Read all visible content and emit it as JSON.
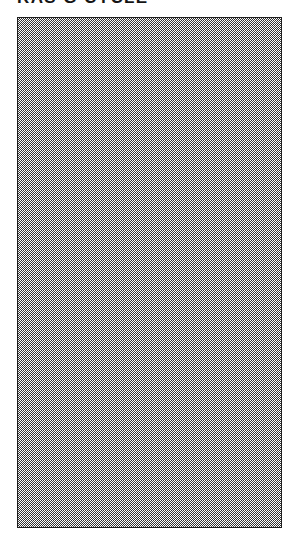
{
  "document": {
    "heading": "RAS G CYCLE",
    "heading_is_clipped_by_page_edge": true,
    "background_color": "#ffffff",
    "text_color": "#151515"
  },
  "figure": {
    "label": "dithered-halftone-field",
    "border_color": "#1d1d1d",
    "fill_description": "uniform 1-pixel checkerboard dither (~50% gray)",
    "fill_dark_color": "#2b2b2b",
    "fill_light_color": "#ffffff",
    "x": 17,
    "y": 17,
    "width": 265,
    "height": 511,
    "content": ""
  }
}
